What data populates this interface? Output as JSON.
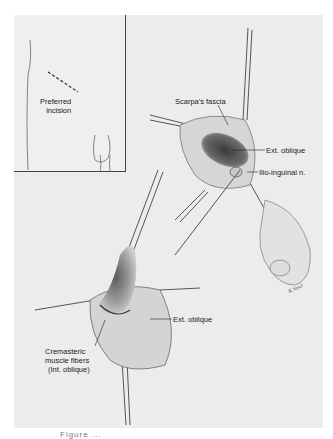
{
  "figure": {
    "inset": {
      "label_line1": "Preferred",
      "label_line2": "incision"
    },
    "upper_panel": {
      "labels": {
        "scarpas_fascia": "Scarpa's fascia",
        "ext_oblique": "Ext. oblique",
        "ilio_inguinal": "Ilio-inguinal n."
      }
    },
    "lower_panel": {
      "labels": {
        "ext_oblique": "Ext. oblique",
        "cremasteric_line1": "Cremasteric",
        "cremasteric_line2": "muscle fibers",
        "cremasteric_line3": "(Int. oblique)"
      }
    },
    "signature": "K.Vasel",
    "caption_cutoff": "Figure ..."
  }
}
